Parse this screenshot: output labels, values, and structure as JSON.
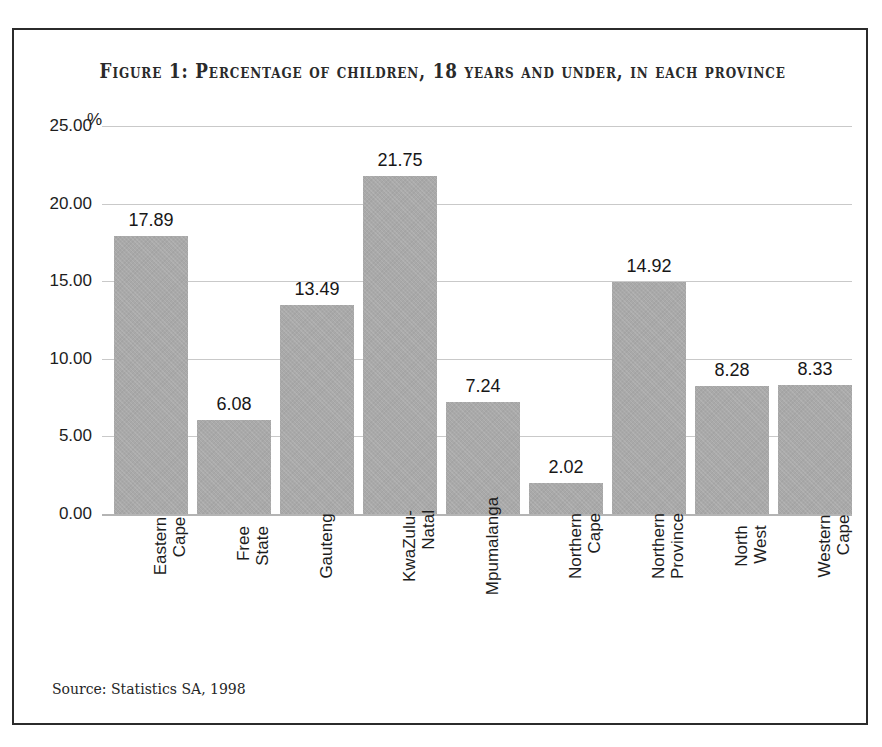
{
  "figure": {
    "title": "Figure 1: Percentage of children, 18 years and under, in each province",
    "source": "Source: Statistics SA, 1998",
    "y_unit": "%",
    "frame_color": "#2b2b2b",
    "bar_color": "#a9a9a9",
    "gridline_color": "#c9c9c9",
    "background": "#ffffff"
  },
  "chart_data": {
    "type": "bar",
    "title": "Figure 1: Percentage of children, 18 years and under, in each province",
    "xlabel": "",
    "ylabel": "%",
    "ylim": [
      0,
      25
    ],
    "yticks": [
      0,
      5,
      10,
      15,
      20,
      25
    ],
    "ytick_labels": [
      "0.00",
      "5.00",
      "10.00",
      "15.00",
      "20.00",
      "25.00"
    ],
    "grid": true,
    "legend": "none",
    "categories": [
      "Eastern Cape",
      "Free State",
      "Gauteng",
      "KwaZulu-Natal",
      "Mpumalanga",
      "Northern Cape",
      "Northern Province",
      "North West",
      "Western Cape"
    ],
    "category_lines": [
      [
        "Eastern",
        "Cape"
      ],
      [
        "Free",
        "State"
      ],
      [
        "Gauteng"
      ],
      [
        "KwaZulu-",
        "Natal"
      ],
      [
        "Mpumalanga"
      ],
      [
        "Northern",
        "Cape"
      ],
      [
        "Northern",
        "Province"
      ],
      [
        "North",
        "West"
      ],
      [
        "Western",
        "Cape"
      ]
    ],
    "values": [
      17.89,
      6.08,
      13.49,
      21.75,
      7.24,
      2.02,
      14.92,
      8.28,
      8.33
    ],
    "value_labels": [
      "17.89",
      "6.08",
      "13.49",
      "21.75",
      "7.24",
      "2.02",
      "14.92",
      "8.28",
      "8.33"
    ],
    "source": "Source: Statistics SA, 1998"
  }
}
